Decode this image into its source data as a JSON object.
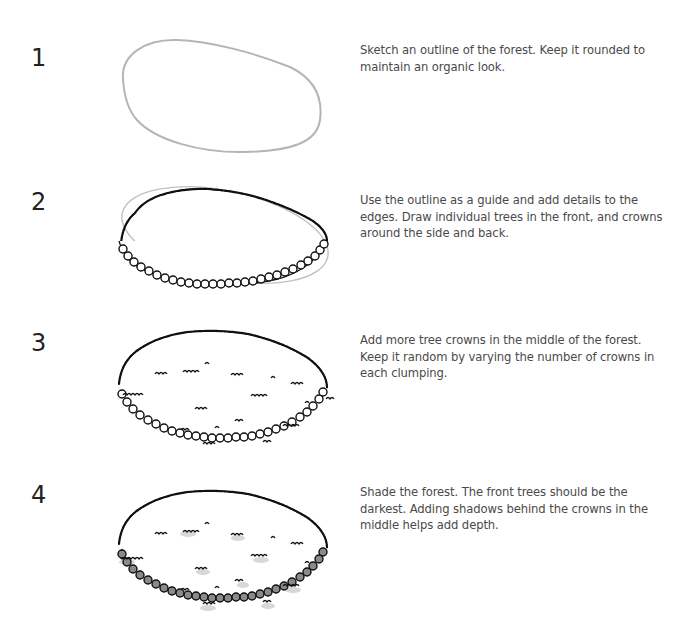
{
  "steps": [
    {
      "number": "1",
      "text": "Sketch an outline of the forest. Keep it rounded to maintain an organic look.",
      "illustration": "forest-outline-sketch"
    },
    {
      "number": "2",
      "text": "Use the outline as a guide and add details to the edges. Draw individual trees in the front, and crowns around the side and back.",
      "illustration": "forest-edges-with-trees"
    },
    {
      "number": "3",
      "text": "Add more tree crowns in the middle of the forest. Keep it random by varying the number of crowns in each clumping.",
      "illustration": "forest-with-crowns"
    },
    {
      "number": "4",
      "text": "Shade the forest. The front trees should be the darkest. Adding shadows behind the crowns in the middle helps add depth.",
      "illustration": "forest-shaded"
    }
  ],
  "colors": {
    "outline_sketch": "#b5b5b5",
    "ink": "#111111",
    "shade_front": "#8a8a8a",
    "shadow_soft": "#c8c8c8"
  }
}
